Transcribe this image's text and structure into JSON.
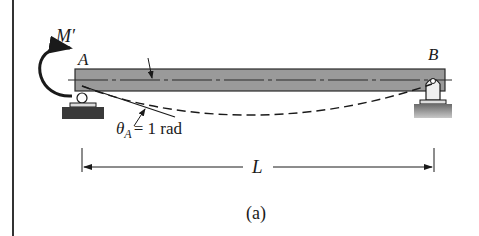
{
  "figure": {
    "caption": "(a)",
    "labels": {
      "moment": "M′",
      "support_a": "A",
      "support_b": "B",
      "rotation_symbol": "θ",
      "rotation_subscript": "A",
      "rotation_value": "= 1 rad",
      "span": "L"
    },
    "colors": {
      "beam_fill": "#9a9a9a",
      "beam_stroke": "#2a2a2a",
      "line": "#1a1a1a",
      "ground_dark": "#3a3a3a",
      "ground_light": "#8a8a8a"
    },
    "elements": [
      "beam",
      "roller-support-a",
      "pin-support-b",
      "applied-moment-arrow",
      "deflected-shape-dashed",
      "tangent-line-at-a",
      "span-dimension"
    ]
  }
}
